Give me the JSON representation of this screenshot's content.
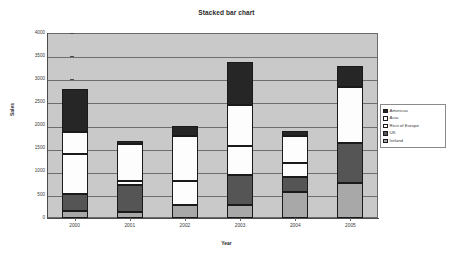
{
  "chart_data": {
    "type": "bar",
    "title": "Stacked bar chart",
    "xlabel": "Year",
    "ylabel": "Sales",
    "categories": [
      "2000",
      "2001",
      "2002",
      "2003",
      "2004",
      "2005"
    ],
    "ylim": [
      0,
      4000
    ],
    "yticks": [
      "0",
      "500",
      "1000",
      "1500",
      "2000",
      "2500",
      "3000",
      "3500",
      "4000"
    ],
    "grid": true,
    "stacked": true,
    "legend_position": "right",
    "series": [
      {
        "name": "Americas",
        "color": "#262626",
        "values": [
          930,
          60,
          200,
          940,
          110,
          450
        ]
      },
      {
        "name": "Asia",
        "color": "#fdfdfd",
        "values": [
          460,
          810,
          970,
          890,
          570,
          1210
        ]
      },
      {
        "name": "Rest of Europe",
        "color": "#fdfdfd",
        "values": [
          860,
          90,
          530,
          610,
          320,
          0
        ]
      },
      {
        "name": "UK",
        "color": "#555555",
        "values": [
          380,
          570,
          0,
          650,
          310,
          870
        ]
      },
      {
        "name": "Ireland",
        "color": "#a8a8a8",
        "values": [
          150,
          140,
          280,
          290,
          570,
          750
        ]
      }
    ],
    "totals": [
      2780,
      1670,
      1980,
      3380,
      1880,
      3280
    ]
  },
  "legend": {
    "entries": [
      {
        "label": "Americas",
        "color": "#262626"
      },
      {
        "label": "Asia",
        "color": "#fdfdfd"
      },
      {
        "label": "Rest of Europe",
        "color": "#fdfdfd"
      },
      {
        "label": "UK",
        "color": "#555555"
      },
      {
        "label": "Ireland",
        "color": "#a8a8a8"
      }
    ]
  }
}
